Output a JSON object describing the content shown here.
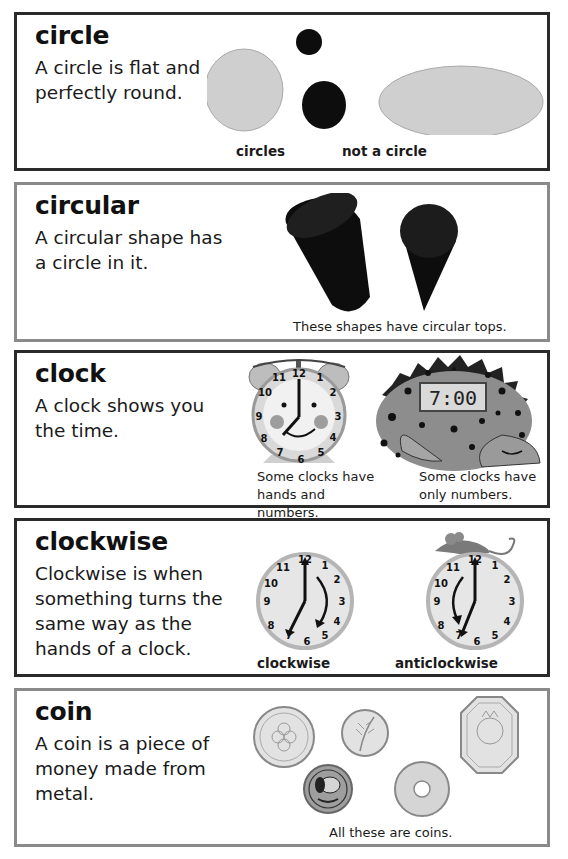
{
  "entries": [
    {
      "word": "circle",
      "definition": "A circle is flat and perfectly round.",
      "captions": [
        "circles",
        "not a circle"
      ],
      "illustrations": [
        "light-gray-circle",
        "small-black-circle",
        "medium-black-circle",
        "light-gray-oval"
      ]
    },
    {
      "word": "circular",
      "definition": "A circular shape has a circle in it.",
      "captions": [
        "These shapes have circular tops."
      ],
      "illustrations": [
        "black-cylinder",
        "black-cone"
      ]
    },
    {
      "word": "clock",
      "definition": "A clock shows you the time.",
      "captions": [
        "Some clocks have hands and numbers.",
        "Some clocks have only numbers."
      ],
      "illustrations": [
        "alarm-clock-face",
        "dinosaur-digital-clock"
      ],
      "digital_time": "7:00",
      "clock_numbers": [
        "12",
        "1",
        "2",
        "3",
        "4",
        "5",
        "6",
        "7",
        "8",
        "9",
        "10",
        "11"
      ]
    },
    {
      "word": "clockwise",
      "definition": "Clockwise is when something turns the same way as the hands of a clock.",
      "captions": [
        "clockwise",
        "anticlockwise"
      ],
      "illustrations": [
        "clock-clockwise-arrow",
        "clock-anticlockwise-arrow-mouse"
      ],
      "clock_numbers": [
        "12",
        "1",
        "2",
        "3",
        "4",
        "5",
        "6",
        "7",
        "8",
        "9",
        "10",
        "11"
      ]
    },
    {
      "word": "coin",
      "definition": "A coin is a piece of money made from metal.",
      "captions": [
        "All these are coins."
      ],
      "illustrations": [
        "flower-coin",
        "leaf-coin",
        "octagonal-lion-coin",
        "dog-coin",
        "coin-with-hole"
      ]
    }
  ],
  "colors": {
    "dark_border": "#2a2a2a",
    "light_border": "#8a8a8a",
    "gray_shape": "#cfcfcf",
    "black_shape": "#0d0d0d"
  }
}
